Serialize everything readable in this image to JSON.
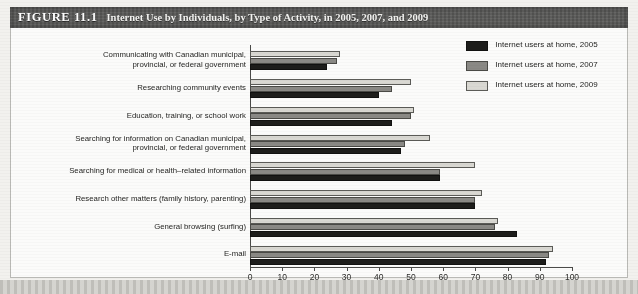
{
  "figure": {
    "number": "FIGURE 11.1",
    "title": "Internet Use by Individuals, by Type of Activity, in 2005, 2007, and 2009"
  },
  "legend": {
    "items": [
      {
        "label": "Internet  users at home, 2005",
        "key": "y2005",
        "color": "#1d1d1b"
      },
      {
        "label": "Internet users at home, 2007",
        "key": "y2007",
        "color": "#8a8985"
      },
      {
        "label": "Internet  users at home, 2009",
        "key": "y2009",
        "color": "#d9d8d2"
      }
    ]
  },
  "axis": {
    "ticks": [
      "0",
      "10",
      "20",
      "30",
      "40",
      "50",
      "60",
      "70",
      "80",
      "90",
      "100"
    ]
  },
  "chart_data": {
    "type": "bar",
    "orientation": "horizontal",
    "title": "Internet Use by Individuals, by Type of Activity, in 2005, 2007, and 2009",
    "xlabel": "",
    "ylabel": "",
    "xlim": [
      0,
      100
    ],
    "xticks": [
      0,
      10,
      20,
      30,
      40,
      50,
      60,
      70,
      80,
      90,
      100
    ],
    "grid": false,
    "legend_position": "top-right",
    "categories": [
      "Communicating with Canadian municipal, provincial, or federal government",
      "Researching community events",
      "Education, training, or school work",
      "Searching for information on Canadian municipal, provincial, or federal government",
      "Searching for medical or health-related information",
      "Research other matters (family history, parenting)",
      "General browsing (surfing)",
      "E-mail"
    ],
    "series": [
      {
        "name": "Internet users at home, 2005",
        "color": "#1d1d1b",
        "values": [
          24,
          40,
          44,
          47,
          59,
          70,
          83,
          92
        ]
      },
      {
        "name": "Internet users at home, 2007",
        "color": "#8a8985",
        "values": [
          27,
          44,
          50,
          48,
          59,
          70,
          76,
          93
        ]
      },
      {
        "name": "Internet users at home, 2009",
        "color": "#d9d8d2",
        "values": [
          28,
          50,
          51,
          56,
          70,
          72,
          77,
          94
        ]
      }
    ]
  },
  "categories_display": [
    [
      "Communicating with Canadian municipal,",
      "provincial, or federal government"
    ],
    [
      "Researching community events"
    ],
    [
      "Education, training, or school work"
    ],
    [
      "Searching for information on Canadian municipal,",
      "provincial, or federal government"
    ],
    [
      "Searching for medical or health–related information"
    ],
    [
      "Research other matters (family history, parenting)"
    ],
    [
      "General browsing (surfing)"
    ],
    [
      "E-mail"
    ]
  ]
}
